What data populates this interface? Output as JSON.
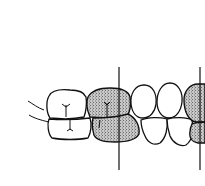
{
  "diagram": {
    "type": "dental occlusion illustration",
    "colors": {
      "line": "#111111",
      "background": "#ffffff",
      "stipple": "#9a9a9a"
    },
    "reference_lines": [
      {
        "x": 119,
        "y1": 67,
        "y2": 170
      },
      {
        "x": 200,
        "y1": 67,
        "y2": 170
      }
    ],
    "shaded_teeth": [
      "upper-premolar",
      "lower-premolar",
      "right-partial-upper",
      "right-partial-lower"
    ],
    "unshaded_teeth": [
      "upper-molar",
      "lower-molar",
      "upper-incisor-1",
      "upper-incisor-2",
      "lower-incisor-1",
      "lower-incisor-2"
    ]
  }
}
